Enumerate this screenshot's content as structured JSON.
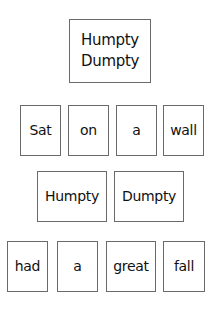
{
  "title_card": {
    "line1": "Humpty",
    "line2": "Dumpty"
  },
  "rows": [
    {
      "words": [
        "Sat",
        "on",
        "a",
        "wall"
      ]
    },
    {
      "words": [
        "Humpty",
        "Dumpty"
      ]
    },
    {
      "words": [
        "had",
        "a",
        "great",
        "fall"
      ]
    }
  ],
  "colors": {
    "border": "#6a6a6a",
    "text": "#111111",
    "background": "#ffffff"
  }
}
